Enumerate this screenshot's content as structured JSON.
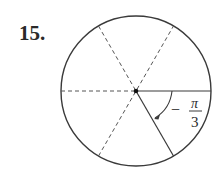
{
  "problem": {
    "number": "15."
  },
  "diagram": {
    "type": "unit-circle-angle",
    "center": [
      136,
      91
    ],
    "radius": 75,
    "dashed_lines_deg": [
      0,
      60,
      120
    ],
    "terminal_side_deg": -60,
    "angle_label": {
      "sign": "−",
      "numerator": "π",
      "denominator": "3"
    },
    "stroke_color": "#3a3a3a"
  }
}
